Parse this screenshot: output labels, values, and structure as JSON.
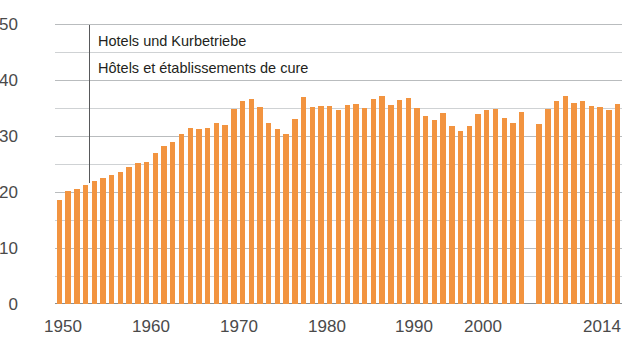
{
  "chart_data": {
    "type": "bar",
    "title": "",
    "subtitle": "",
    "xlabel": "",
    "ylabel": "",
    "ylim": [
      0,
      50
    ],
    "xlim": [
      1950,
      2014
    ],
    "grid": true,
    "legend_position": "inside-top-left",
    "annotations": [
      "Hotels und Kurbetriebe",
      "Hôtels et établissements de cure"
    ],
    "y_ticks": [
      0,
      10,
      20,
      30,
      40,
      50
    ],
    "y_ticks_minor": [
      5,
      15,
      25,
      35,
      45
    ],
    "x_ticks": [
      1950,
      1960,
      1970,
      1980,
      1990,
      2000,
      2014
    ],
    "x_tick_labels": [
      "1950",
      "1960",
      "1970",
      "1980",
      "1990",
      "2000",
      "2014"
    ],
    "bar_color": "#F29440",
    "series": [
      {
        "name": "Hotels und Kurbetriebe / Hôtels et établissements de cure",
        "categories": [
          1950,
          1951,
          1952,
          1953,
          1954,
          1955,
          1956,
          1957,
          1958,
          1959,
          1960,
          1961,
          1962,
          1963,
          1964,
          1965,
          1966,
          1967,
          1968,
          1969,
          1970,
          1971,
          1972,
          1973,
          1974,
          1975,
          1976,
          1977,
          1978,
          1979,
          1980,
          1981,
          1982,
          1983,
          1984,
          1985,
          1986,
          1987,
          1988,
          1989,
          1990,
          1991,
          1992,
          1993,
          1994,
          1995,
          1996,
          1997,
          1998,
          1999,
          2000,
          2001,
          2002,
          2003,
          2004,
          2005,
          2006,
          2007,
          2008,
          2009,
          2010,
          2011,
          2012,
          2013,
          2014
        ],
        "values": [
          18.6,
          20.2,
          20.6,
          21.3,
          22.0,
          22.5,
          23.1,
          23.6,
          24.4,
          25.1,
          25.4,
          27.0,
          28.3,
          29.0,
          30.4,
          31.5,
          31.2,
          31.4,
          32.4,
          32.0,
          34.8,
          36.3,
          36.6,
          35.2,
          32.4,
          31.2,
          30.4,
          33.1,
          36.9,
          35.1,
          35.3,
          35.4,
          34.7,
          35.5,
          35.8,
          35.0,
          36.6,
          37.1,
          35.6,
          36.4,
          36.8,
          35.0,
          33.6,
          32.9,
          34.1,
          31.8,
          30.9,
          31.7,
          33.9,
          34.6,
          34.8,
          33.2,
          32.4,
          34.2,
          null,
          32.2,
          34.8,
          36.2,
          37.2,
          35.9,
          36.3,
          35.3,
          35.1,
          34.7,
          35.7
        ]
      }
    ],
    "missing_year": 2004,
    "note": "Vertical leader line from annotation down to 1953 bar top (~22)"
  },
  "annotation": {
    "line1": "Hotels und Kurbetriebe",
    "line2": "Hôtels et établissements de cure"
  }
}
